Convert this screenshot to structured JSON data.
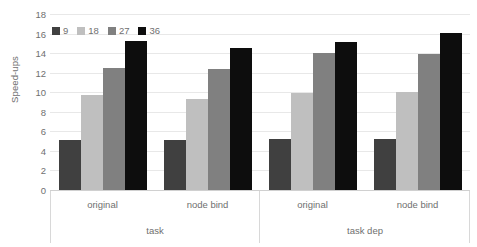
{
  "chart_data": {
    "type": "bar",
    "title": "",
    "xlabel": "",
    "ylabel": "Speed-ups",
    "ylim": [
      0,
      18
    ],
    "ytick_labels": [
      "18",
      "16",
      "14",
      "12",
      "10",
      "8",
      "6",
      "4",
      "2",
      "0"
    ],
    "ytick_values": [
      18,
      16,
      14,
      12,
      10,
      8,
      6,
      4,
      2,
      0
    ],
    "grid": true,
    "legend_position": "top-left",
    "categories": [
      "original",
      "node bind",
      "original",
      "node bind"
    ],
    "group_labels": [
      "task",
      "task",
      "task dep",
      "task dep"
    ],
    "outer_categories": [
      "task",
      "task dep"
    ],
    "series": [
      {
        "name": "9",
        "color": "#404040",
        "values": [
          5.1,
          5.1,
          5.2,
          5.2
        ]
      },
      {
        "name": "18",
        "color": "#bfbfbf",
        "values": [
          9.7,
          9.3,
          9.9,
          10.0
        ]
      },
      {
        "name": "27",
        "color": "#808080",
        "values": [
          12.5,
          12.4,
          14.0,
          13.9
        ]
      },
      {
        "name": "36",
        "color": "#0d0d0d",
        "values": [
          15.2,
          14.5,
          15.1,
          16.1
        ]
      }
    ]
  },
  "legend": {
    "items": [
      {
        "label": "9",
        "color": "#404040"
      },
      {
        "label": "18",
        "color": "#bfbfbf"
      },
      {
        "label": "27",
        "color": "#808080"
      },
      {
        "label": "36",
        "color": "#0d0d0d"
      }
    ]
  },
  "colors": {
    "background": "#ffffff",
    "gridline": "#e8e8e8",
    "axis_line": "#d0d0d0",
    "tick_separator": "#d8d8d8",
    "text": "#6f6f6f"
  }
}
